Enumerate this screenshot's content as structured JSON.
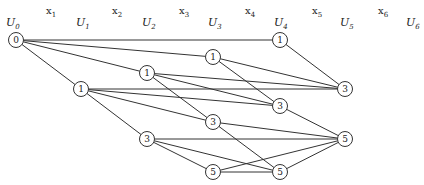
{
  "diagram": {
    "type": "staged-network",
    "stage_labels": [
      {
        "id": "U0",
        "text": "U",
        "sub": "0",
        "x": 6,
        "y": 26
      },
      {
        "id": "U1",
        "text": "U",
        "sub": "1",
        "x": 76,
        "y": 26
      },
      {
        "id": "U2",
        "text": "U",
        "sub": "2",
        "x": 142,
        "y": 26
      },
      {
        "id": "U3",
        "text": "U",
        "sub": "3",
        "x": 208,
        "y": 26
      },
      {
        "id": "U4",
        "text": "U",
        "sub": "4",
        "x": 274,
        "y": 26
      },
      {
        "id": "U5",
        "text": "U",
        "sub": "5",
        "x": 340,
        "y": 26
      },
      {
        "id": "U6",
        "text": "U",
        "sub": "6",
        "x": 406,
        "y": 26
      }
    ],
    "decision_labels": [
      {
        "id": "x1",
        "text": "x",
        "sub": "1",
        "x": 46,
        "y": 14
      },
      {
        "id": "x2",
        "text": "x",
        "sub": "2",
        "x": 112,
        "y": 14
      },
      {
        "id": "x3",
        "text": "x",
        "sub": "3",
        "x": 179,
        "y": 14
      },
      {
        "id": "x4",
        "text": "x",
        "sub": "4",
        "x": 245,
        "y": 14
      },
      {
        "id": "x5",
        "text": "x",
        "sub": "5",
        "x": 312,
        "y": 14
      },
      {
        "id": "x6",
        "text": "x",
        "sub": "6",
        "x": 378,
        "y": 14
      }
    ],
    "nodes": [
      {
        "id": "n0",
        "stage": "U0",
        "label": "0",
        "x": 16,
        "y": 40
      },
      {
        "id": "n1a",
        "stage": "U1",
        "label": "1",
        "x": 81,
        "y": 89
      },
      {
        "id": "n2a",
        "stage": "U2",
        "label": "1",
        "x": 147,
        "y": 73
      },
      {
        "id": "n2b",
        "stage": "U2",
        "label": "3",
        "x": 147,
        "y": 139
      },
      {
        "id": "n3a",
        "stage": "U3",
        "label": "1",
        "x": 213,
        "y": 57
      },
      {
        "id": "n3b",
        "stage": "U3",
        "label": "3",
        "x": 213,
        "y": 122
      },
      {
        "id": "n3c",
        "stage": "U3",
        "label": "5",
        "x": 213,
        "y": 172
      },
      {
        "id": "n4a",
        "stage": "U4",
        "label": "1",
        "x": 280,
        "y": 40
      },
      {
        "id": "n4b",
        "stage": "U4",
        "label": "3",
        "x": 280,
        "y": 106
      },
      {
        "id": "n4c",
        "stage": "U4",
        "label": "5",
        "x": 280,
        "y": 172
      },
      {
        "id": "n5a",
        "stage": "U5",
        "label": "3",
        "x": 345,
        "y": 89
      },
      {
        "id": "n5b",
        "stage": "U5",
        "label": "5",
        "x": 345,
        "y": 139
      }
    ],
    "edges": [
      [
        "n0",
        "n4a"
      ],
      [
        "n0",
        "n3a"
      ],
      [
        "n0",
        "n2a"
      ],
      [
        "n0",
        "n1a"
      ],
      [
        "n1a",
        "n5a"
      ],
      [
        "n1a",
        "n4b"
      ],
      [
        "n1a",
        "n3b"
      ],
      [
        "n1a",
        "n2b"
      ],
      [
        "n2a",
        "n5a"
      ],
      [
        "n2a",
        "n4b"
      ],
      [
        "n2a",
        "n3b"
      ],
      [
        "n3a",
        "n5a"
      ],
      [
        "n3a",
        "n4b"
      ],
      [
        "n4a",
        "n5a"
      ],
      [
        "n2b",
        "n5b"
      ],
      [
        "n2b",
        "n4c"
      ],
      [
        "n2b",
        "n3c"
      ],
      [
        "n3b",
        "n5b"
      ],
      [
        "n3b",
        "n4c"
      ],
      [
        "n4b",
        "n5b"
      ],
      [
        "n3c",
        "n5b"
      ],
      [
        "n3c",
        "n4c"
      ],
      [
        "n4c",
        "n5b"
      ]
    ]
  }
}
